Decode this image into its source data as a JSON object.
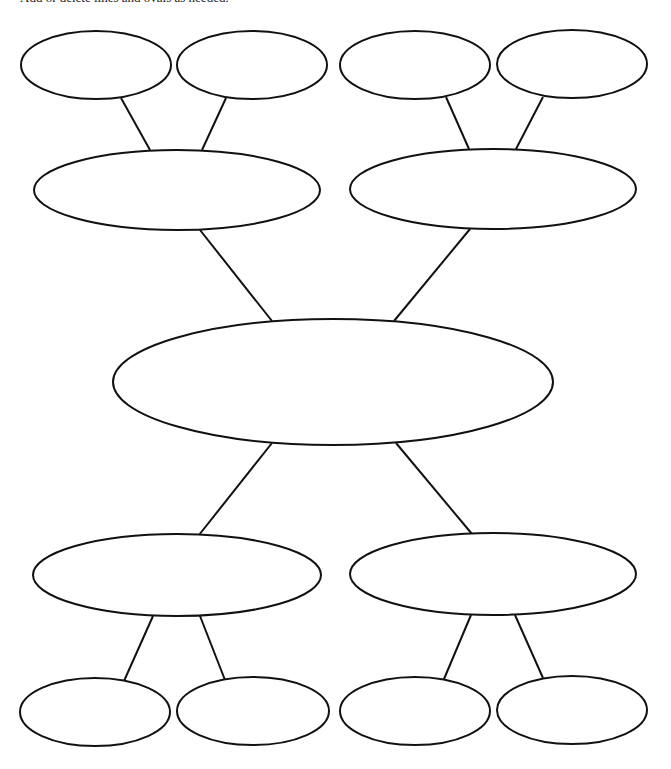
{
  "instruction": {
    "text": "Add or delete lines and ovals as needed."
  },
  "style": {
    "stroke_color": "#111111",
    "fill_color": "#ffffff",
    "background": "#ffffff"
  },
  "diagram": {
    "type": "web-organizer",
    "central": {
      "label": "",
      "cx": 333,
      "cy": 382,
      "rx": 220,
      "ry": 63
    },
    "branches": [
      {
        "position": "top-left",
        "node": {
          "label": "",
          "cx": 177,
          "cy": 190,
          "rx": 143,
          "ry": 40
        },
        "leaves": [
          {
            "label": "",
            "cx": 96,
            "cy": 65,
            "rx": 75,
            "ry": 34
          },
          {
            "label": "",
            "cx": 252,
            "cy": 65,
            "rx": 75,
            "ry": 34
          }
        ]
      },
      {
        "position": "top-right",
        "node": {
          "label": "",
          "cx": 493,
          "cy": 189,
          "rx": 143,
          "ry": 40
        },
        "leaves": [
          {
            "label": "",
            "cx": 415,
            "cy": 65,
            "rx": 75,
            "ry": 34
          },
          {
            "label": "",
            "cx": 572,
            "cy": 64,
            "rx": 75,
            "ry": 34
          }
        ]
      },
      {
        "position": "bottom-left",
        "node": {
          "label": "",
          "cx": 177,
          "cy": 575,
          "rx": 144,
          "ry": 41
        },
        "leaves": [
          {
            "label": "",
            "cx": 95,
            "cy": 712,
            "rx": 75,
            "ry": 34
          },
          {
            "label": "",
            "cx": 253,
            "cy": 711,
            "rx": 76,
            "ry": 34
          }
        ]
      },
      {
        "position": "bottom-right",
        "node": {
          "label": "",
          "cx": 493,
          "cy": 574,
          "rx": 143,
          "ry": 41
        },
        "leaves": [
          {
            "label": "",
            "cx": 415,
            "cy": 711,
            "rx": 75,
            "ry": 34
          },
          {
            "label": "",
            "cx": 572,
            "cy": 710,
            "rx": 75,
            "ry": 34
          }
        ]
      }
    ],
    "connectors": [
      {
        "from": "top-left-leaf-1",
        "to": "top-left-node",
        "x1": 121,
        "y1": 98,
        "x2": 150,
        "y2": 150
      },
      {
        "from": "top-left-leaf-2",
        "to": "top-left-node",
        "x1": 226,
        "y1": 98,
        "x2": 202,
        "y2": 150
      },
      {
        "from": "top-right-leaf-1",
        "to": "top-right-node",
        "x1": 446,
        "y1": 97,
        "x2": 469,
        "y2": 149
      },
      {
        "from": "top-right-leaf-2",
        "to": "top-right-node",
        "x1": 543,
        "y1": 97,
        "x2": 516,
        "y2": 149
      },
      {
        "from": "top-left-node",
        "to": "central",
        "x1": 200,
        "y1": 230,
        "x2": 272,
        "y2": 321
      },
      {
        "from": "top-right-node",
        "to": "central",
        "x1": 470,
        "y1": 229,
        "x2": 394,
        "y2": 321
      },
      {
        "from": "central",
        "to": "bottom-left-node",
        "x1": 272,
        "y1": 443,
        "x2": 199,
        "y2": 535
      },
      {
        "from": "central",
        "to": "bottom-right-node",
        "x1": 396,
        "y1": 443,
        "x2": 472,
        "y2": 534
      },
      {
        "from": "bottom-left-node",
        "to": "bottom-left-leaf-1",
        "x1": 153,
        "y1": 616,
        "x2": 124,
        "y2": 681
      },
      {
        "from": "bottom-left-node",
        "to": "bottom-left-leaf-2",
        "x1": 200,
        "y1": 616,
        "x2": 225,
        "y2": 680
      },
      {
        "from": "bottom-right-node",
        "to": "bottom-right-leaf-1",
        "x1": 471,
        "y1": 615,
        "x2": 444,
        "y2": 679
      },
      {
        "from": "bottom-right-node",
        "to": "bottom-right-leaf-2",
        "x1": 515,
        "y1": 615,
        "x2": 543,
        "y2": 678
      }
    ]
  }
}
